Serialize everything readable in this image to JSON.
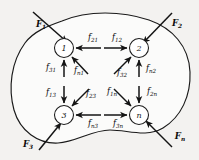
{
  "figure": {
    "background_color": "#f3f2f0",
    "body_fill_color": "#fbfbfa",
    "stroke_color": "#141414",
    "boundary_name": "system-boundary-blob"
  },
  "nodes": [
    {
      "id": "node-1",
      "label": "1",
      "cx": 64,
      "cy": 48,
      "r": 9.5
    },
    {
      "id": "node-2",
      "label": "2",
      "cx": 139,
      "cy": 48,
      "r": 9.5
    },
    {
      "id": "node-3",
      "label": "3",
      "cx": 64,
      "cy": 115,
      "r": 9.5
    },
    {
      "id": "node-n",
      "label": "n",
      "cx": 139,
      "cy": 115,
      "r": 9.5
    }
  ],
  "internal_forces": [
    {
      "id": "f21",
      "base": "f",
      "sub": "21",
      "from": "2",
      "to": "1",
      "direction": "left",
      "label_x": 93,
      "label_y": 40
    },
    {
      "id": "f12",
      "base": "f",
      "sub": "12",
      "from": "1",
      "to": "2",
      "direction": "right",
      "label_x": 117,
      "label_y": 40
    },
    {
      "id": "f31",
      "base": "f",
      "sub": "31",
      "from": "3",
      "to": "1",
      "direction": "up",
      "label_x": 51,
      "label_y": 70
    },
    {
      "id": "fn1",
      "base": "f",
      "sub": "n1",
      "from": "n",
      "to": "1",
      "direction": "up-left",
      "label_x": 79,
      "label_y": 73
    },
    {
      "id": "f32",
      "base": "f",
      "sub": "32",
      "from": "3",
      "to": "2",
      "direction": "up-right",
      "label_x": 122,
      "label_y": 75
    },
    {
      "id": "fn2",
      "base": "f",
      "sub": "n2",
      "from": "n",
      "to": "2",
      "direction": "up",
      "label_x": 151,
      "label_y": 71
    },
    {
      "id": "f13",
      "base": "f",
      "sub": "13",
      "from": "1",
      "to": "3",
      "direction": "down",
      "label_x": 51,
      "label_y": 95
    },
    {
      "id": "f23",
      "base": "f",
      "sub": "23",
      "from": "2",
      "to": "3",
      "direction": "down-left",
      "label_x": 91,
      "label_y": 96
    },
    {
      "id": "f1n",
      "base": "f",
      "sub": "1n",
      "from": "1",
      "to": "n",
      "direction": "down-right",
      "label_x": 112,
      "label_y": 94
    },
    {
      "id": "f2n",
      "base": "f",
      "sub": "2n",
      "from": "2",
      "to": "n",
      "direction": "down",
      "label_x": 152,
      "label_y": 94
    },
    {
      "id": "fn3",
      "base": "f",
      "sub": "n3",
      "from": "n",
      "to": "3",
      "direction": "left",
      "label_x": 93,
      "label_y": 126
    },
    {
      "id": "f3n",
      "base": "f",
      "sub": "3n",
      "from": "3",
      "to": "n",
      "direction": "right",
      "label_x": 118,
      "label_y": 126
    }
  ],
  "external_forces": [
    {
      "id": "F1",
      "base": "F",
      "sub": "1",
      "corner": "top-left",
      "label_x": 41,
      "label_y": 27
    },
    {
      "id": "F2",
      "base": "F",
      "sub": "2",
      "corner": "top-right",
      "label_x": 177,
      "label_y": 26
    },
    {
      "id": "F3",
      "base": "F",
      "sub": "3",
      "corner": "bottom-left",
      "label_x": 28,
      "label_y": 147
    },
    {
      "id": "Fn",
      "base": "F",
      "sub": "n",
      "corner": "bottom-right",
      "label_x": 180,
      "label_y": 139
    }
  ]
}
